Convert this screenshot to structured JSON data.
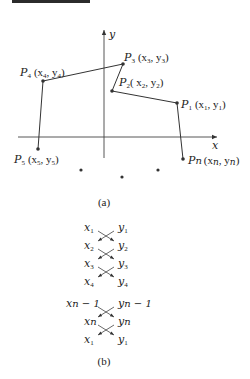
{
  "figure_a": {
    "caption": "(a)",
    "axes": {
      "x_label": "x",
      "y_label": "y"
    },
    "points": [
      {
        "id": "P1",
        "name": "P",
        "sub": "1",
        "coord": "(x",
        "csub": "1",
        "mid": ", y",
        "ysub": "1",
        "end": ")"
      },
      {
        "id": "P2",
        "name": "P",
        "sub": "2",
        "coord": "( x",
        "csub": "2",
        "mid": ", y",
        "ysub": "2",
        "end": ")"
      },
      {
        "id": "P3",
        "name": "P",
        "sub": "3",
        "coord": "(x",
        "csub": "3",
        "mid": ", y",
        "ysub": "3",
        "end": ")"
      },
      {
        "id": "P4",
        "name": "P",
        "sub": "4",
        "coord": "(x",
        "csub": "4",
        "mid": ", y",
        "ysub": "4",
        "end": ")"
      },
      {
        "id": "P5",
        "name": "P",
        "sub": "5",
        "coord": "(x",
        "csub": "5",
        "mid": ", y",
        "ysub": "5",
        "end": ")"
      },
      {
        "id": "Pn",
        "name": "P",
        "sub": "n",
        "coord": "(x",
        "csub": "n",
        "mid": ", y",
        "ysub": "n",
        "end": ")"
      }
    ],
    "polyline_order": [
      "P5",
      "P4",
      "P3",
      "P2",
      "P1",
      "Pn"
    ],
    "ellipsis_dots": 3
  },
  "figure_b": {
    "caption": "(b)",
    "rows_top": [
      {
        "x": "x",
        "xsub": "1",
        "y": "y",
        "ysub": "1"
      },
      {
        "x": "x",
        "xsub": "2",
        "y": "y",
        "ysub": "2"
      },
      {
        "x": "x",
        "xsub": "3",
        "y": "y",
        "ysub": "3"
      },
      {
        "x": "x",
        "xsub": "4",
        "y": "y",
        "ysub": "4"
      }
    ],
    "rows_bottom": [
      {
        "x": "x",
        "xsub": "n − 1",
        "y": "y",
        "ysub": "n − 1"
      },
      {
        "x": "x",
        "xsub": "n",
        "y": "y",
        "ysub": "n"
      },
      {
        "x": "x",
        "xsub": "1",
        "y": "y",
        "ysub": "1"
      }
    ]
  }
}
